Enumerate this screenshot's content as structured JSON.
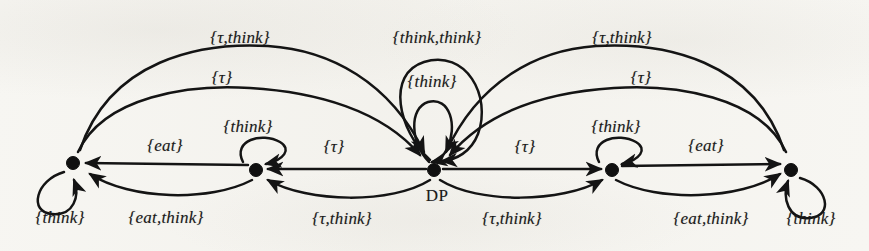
{
  "figure": {
    "type": "state-transition-diagram",
    "background_color": "#f7f6f2",
    "ink_color": "#141414",
    "width": 869,
    "height": 251
  },
  "nodes": [
    {
      "id": "n1",
      "name": "state-node-1",
      "label": "",
      "x": 73,
      "y": 163
    },
    {
      "id": "n2",
      "name": "state-node-2",
      "label": "",
      "x": 256,
      "y": 170
    },
    {
      "id": "n3",
      "name": "state-node-dp",
      "label": "DP",
      "x": 434,
      "y": 170
    },
    {
      "id": "n4",
      "name": "state-node-4",
      "label": "",
      "x": 612,
      "y": 170
    },
    {
      "id": "n5",
      "name": "state-node-5",
      "label": "",
      "x": 791,
      "y": 170
    }
  ],
  "edge_labels": [
    {
      "id": "L1",
      "name": "edge-label-tau-think-top-left",
      "text": "{τ,think}",
      "x": 240,
      "y": 38
    },
    {
      "id": "L2",
      "name": "edge-label-tau-upper-left",
      "text": "{τ}",
      "x": 222,
      "y": 78
    },
    {
      "id": "L3",
      "name": "edge-label-think-left-inner",
      "text": "{think}",
      "x": 248,
      "y": 127
    },
    {
      "id": "L4",
      "name": "edge-label-think-think-center-top",
      "text": "{think,think}",
      "x": 437,
      "y": 38
    },
    {
      "id": "L5",
      "name": "edge-label-think-center-loop",
      "text": "{think}",
      "x": 432,
      "y": 82
    },
    {
      "id": "L6",
      "name": "edge-label-tau-think-top-right",
      "text": "{τ,think}",
      "x": 622,
      "y": 38
    },
    {
      "id": "L7",
      "name": "edge-label-tau-upper-right",
      "text": "{τ}",
      "x": 641,
      "y": 78
    },
    {
      "id": "L8",
      "name": "edge-label-think-right-inner",
      "text": "{think}",
      "x": 616,
      "y": 127
    },
    {
      "id": "L9",
      "name": "edge-label-eat-left",
      "text": "{eat}",
      "x": 165,
      "y": 146
    },
    {
      "id": "L10",
      "name": "edge-label-tau-mid-left",
      "text": "{τ}",
      "x": 334,
      "y": 147
    },
    {
      "id": "L11",
      "name": "edge-label-tau-mid-right",
      "text": "{τ}",
      "x": 525,
      "y": 147
    },
    {
      "id": "L12",
      "name": "edge-label-eat-right",
      "text": "{eat}",
      "x": 706,
      "y": 146
    },
    {
      "id": "L13",
      "name": "edge-label-think-selfloop-left",
      "text": "{think}",
      "x": 60,
      "y": 218
    },
    {
      "id": "L14",
      "name": "edge-label-eat-think-left",
      "text": "{eat,think}",
      "x": 166,
      "y": 218
    },
    {
      "id": "L15",
      "name": "edge-label-tau-think-bottom-left",
      "text": "{τ,think}",
      "x": 342,
      "y": 219
    },
    {
      "id": "L16",
      "name": "edge-label-tau-think-bottom-right",
      "text": "{τ,think}",
      "x": 512,
      "y": 219
    },
    {
      "id": "L17",
      "name": "edge-label-eat-think-right",
      "text": "{eat,think}",
      "x": 711,
      "y": 219
    },
    {
      "id": "L18",
      "name": "edge-label-think-selfloop-right",
      "text": "{think}",
      "x": 811,
      "y": 219
    }
  ]
}
